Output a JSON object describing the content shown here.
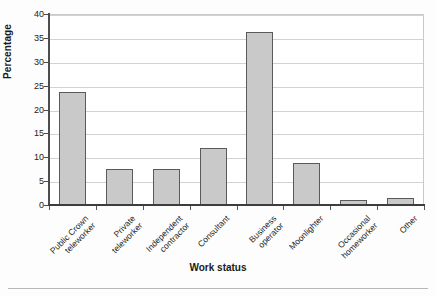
{
  "chart_data": {
    "type": "bar",
    "title": "",
    "subtitle": "",
    "xlabel": "Work status",
    "ylabel": "Percentage",
    "categories": [
      "Public Crown\nteleworker",
      "Private\nteleworker",
      "Independent\ncontractor",
      "Consultant",
      "Business\noperator",
      "Moonlighter",
      "Occasional\nhomeworker",
      "Other"
    ],
    "values": [
      23.6,
      7.5,
      7.6,
      11.9,
      36.3,
      8.8,
      1.0,
      1.5
    ],
    "ylim": [
      0,
      40
    ],
    "ytick_values": [
      0,
      5,
      10,
      15,
      20,
      25,
      30,
      35,
      40
    ],
    "ytick_labels": [
      "0",
      "5",
      "10",
      "15",
      "20",
      "25",
      "30",
      "35",
      "40"
    ],
    "grid": true,
    "grid_axis": "y",
    "legend": false,
    "legend_position": "none",
    "bar_fill_color": "#c9c9c9",
    "bar_edge_color": "#5a5a5a",
    "gridline_color": "#d2d2d2",
    "axis_color": "#4d4d4d",
    "background_color": "#ffffff"
  },
  "figure": {
    "plot_border_color": "#c9c9c9",
    "bottom_rule_color": "#b8b8b8"
  }
}
